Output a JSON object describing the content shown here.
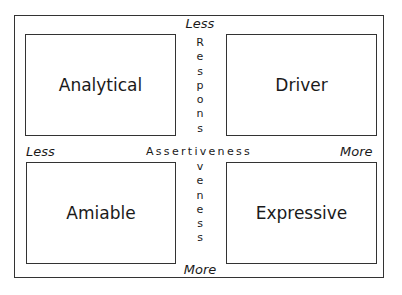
{
  "diagram": {
    "quadrants": {
      "top_left": "Analytical",
      "top_right": "Driver",
      "bottom_left": "Amiable",
      "bottom_right": "Expressive"
    },
    "vertical_axis": {
      "label": "Responsiveness",
      "top_label": "Less",
      "bottom_label": "More",
      "upper_letters": [
        "R",
        "e",
        "s",
        "p",
        "o",
        "n",
        "s"
      ],
      "lower_letters": [
        "v",
        "e",
        "n",
        "e",
        "s",
        "s"
      ]
    },
    "horizontal_axis": {
      "label": "Assertiveness",
      "left_label": "Less",
      "right_label": "More"
    }
  }
}
